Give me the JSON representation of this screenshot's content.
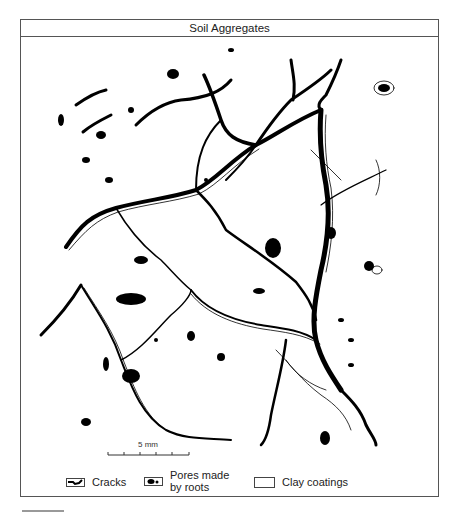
{
  "figure": {
    "title": "Soil Aggregates",
    "scale_bar": {
      "label": "5 mm",
      "ticks": 6
    },
    "legend": [
      {
        "id": "cracks",
        "label": "Cracks",
        "swatch": "crack-line"
      },
      {
        "id": "pores",
        "label": "Pores made by roots",
        "label_line1": "Pores made",
        "label_line2": "by roots",
        "swatch": "black-blobs"
      },
      {
        "id": "clay",
        "label": "Clay coatings",
        "swatch": "empty-box"
      }
    ],
    "colors": {
      "ink": "#000000",
      "paper": "#ffffff",
      "frame": "#555555"
    }
  }
}
